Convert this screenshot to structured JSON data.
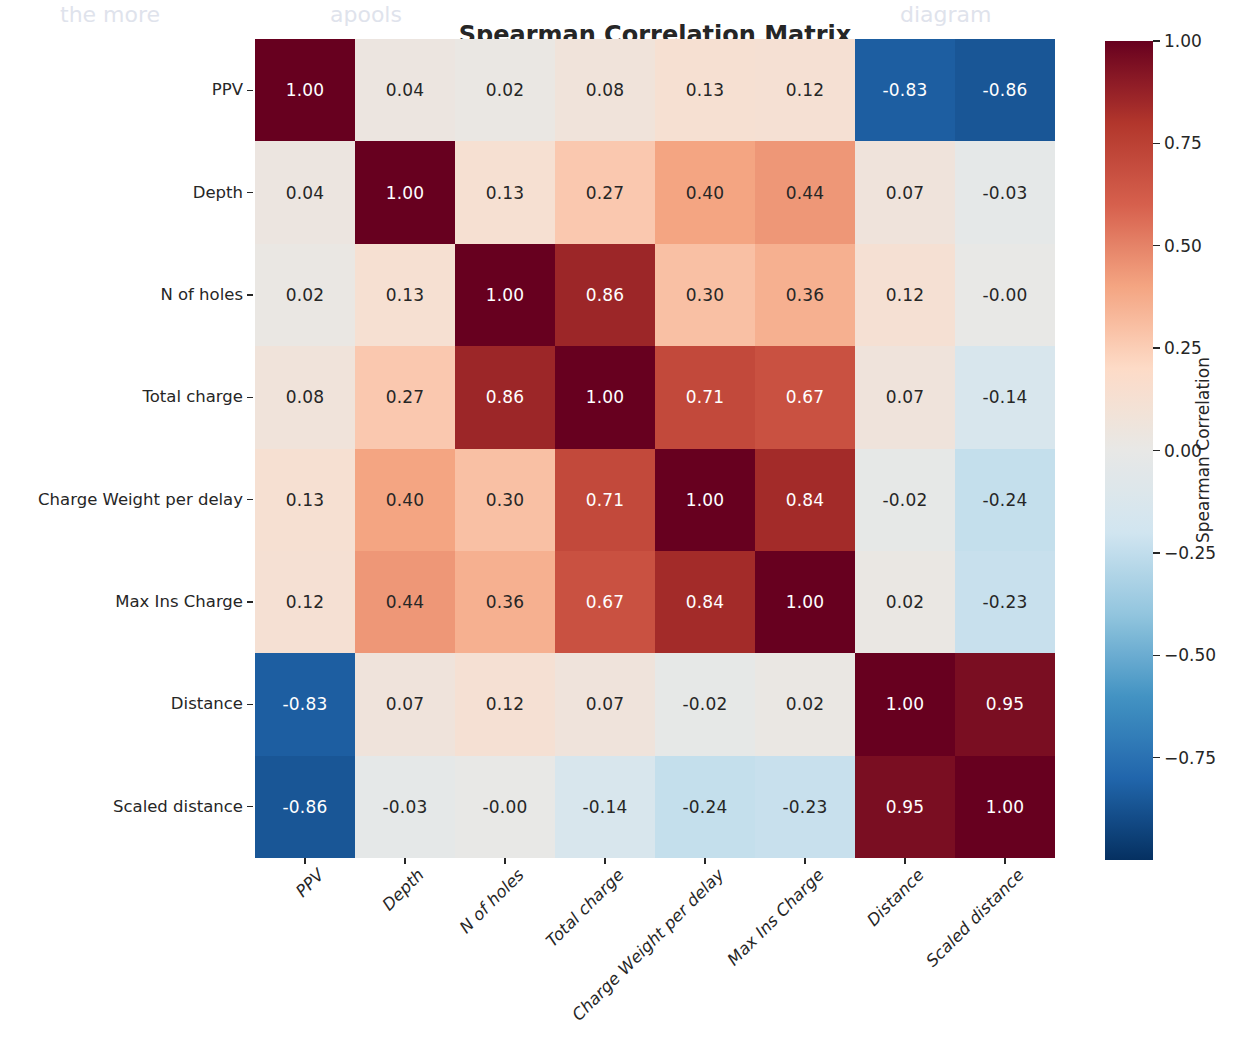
{
  "chart_data": {
    "type": "heatmap",
    "title": "Spearman Correlation Matrix",
    "xlabel": "",
    "ylabel": "",
    "grid": false,
    "legend_position": "right",
    "colorbar": {
      "label": "Spearman Correlation",
      "ticks": [
        "1.00",
        "0.75",
        "0.50",
        "0.25",
        "0.00",
        "−0.25",
        "−0.50",
        "−0.75"
      ],
      "tick_values": [
        1.0,
        0.75,
        0.5,
        0.25,
        0.0,
        -0.25,
        -0.5,
        -0.75
      ],
      "vmin": -1.0,
      "vmax": 1.0,
      "colormap": "RdBu_r",
      "color_low": "#3b5fae",
      "color_mid": "#e8e8e6",
      "color_high": "#a92f26"
    },
    "categories": [
      "PPV",
      "Depth",
      "N of holes",
      "Total charge",
      "Charge Weight per delay",
      "Max Ins Charge",
      "Distance",
      "Scaled distance"
    ],
    "x_tick_labels": [
      "PPV",
      "Depth",
      "N of holes",
      "Total charge",
      "Charge Weight per delay",
      "Max Ins Charge",
      "Distance",
      "Scaled distance"
    ],
    "y_tick_labels": [
      "PPV",
      "Depth",
      "N of holes",
      "Total charge",
      "Charge Weight per delay",
      "Max Ins Charge",
      "Distance",
      "Scaled distance"
    ],
    "values": [
      [
        1.0,
        0.04,
        0.02,
        0.08,
        0.13,
        0.12,
        -0.83,
        -0.86
      ],
      [
        0.04,
        1.0,
        0.13,
        0.27,
        0.4,
        0.44,
        0.07,
        -0.03
      ],
      [
        0.02,
        0.13,
        1.0,
        0.86,
        0.3,
        0.36,
        0.12,
        -0.0
      ],
      [
        0.08,
        0.27,
        0.86,
        1.0,
        0.71,
        0.67,
        0.07,
        -0.14
      ],
      [
        0.13,
        0.4,
        0.3,
        0.71,
        1.0,
        0.84,
        -0.02,
        -0.24
      ],
      [
        0.12,
        0.44,
        0.36,
        0.67,
        0.84,
        1.0,
        0.02,
        -0.23
      ],
      [
        -0.83,
        0.07,
        0.12,
        0.07,
        -0.02,
        0.02,
        1.0,
        0.95
      ],
      [
        -0.86,
        -0.03,
        -0.0,
        -0.14,
        -0.24,
        -0.23,
        0.95,
        1.0
      ]
    ],
    "annotations": [
      [
        "1.00",
        "0.04",
        "0.02",
        "0.08",
        "0.13",
        "0.12",
        "-0.83",
        "-0.86"
      ],
      [
        "0.04",
        "1.00",
        "0.13",
        "0.27",
        "0.40",
        "0.44",
        "0.07",
        "-0.03"
      ],
      [
        "0.02",
        "0.13",
        "1.00",
        "0.86",
        "0.30",
        "0.36",
        "0.12",
        "-0.00"
      ],
      [
        "0.08",
        "0.27",
        "0.86",
        "1.00",
        "0.71",
        "0.67",
        "0.07",
        "-0.14"
      ],
      [
        "0.13",
        "0.40",
        "0.30",
        "0.71",
        "1.00",
        "0.84",
        "-0.02",
        "-0.24"
      ],
      [
        "0.12",
        "0.44",
        "0.36",
        "0.67",
        "0.84",
        "1.00",
        "0.02",
        "-0.23"
      ],
      [
        "-0.83",
        "0.07",
        "0.12",
        "0.07",
        "-0.02",
        "0.02",
        "1.00",
        "0.95"
      ],
      [
        "-0.86",
        "-0.03",
        "-0.00",
        "-0.14",
        "-0.24",
        "-0.23",
        "0.95",
        "1.00"
      ]
    ]
  }
}
